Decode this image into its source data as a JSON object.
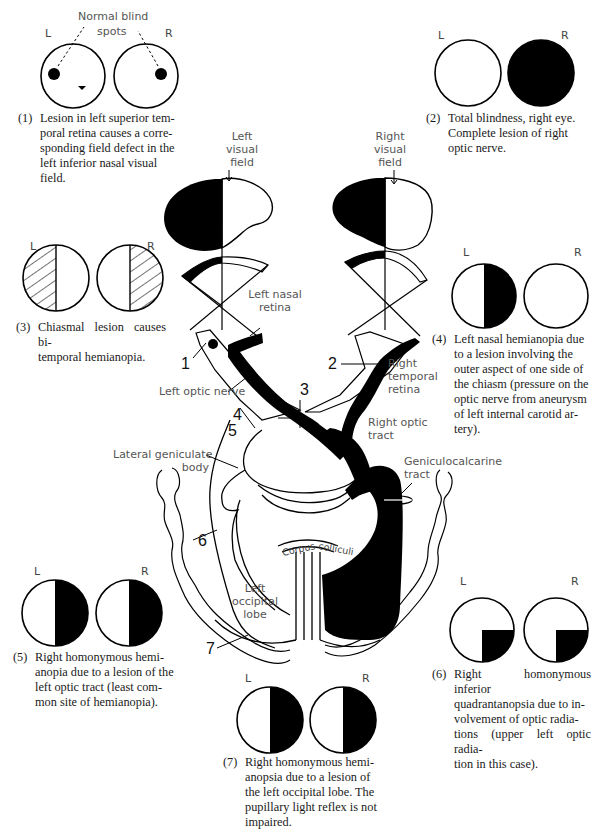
{
  "panels": [
    {
      "id": 1,
      "eye_left": "L",
      "eye_right": "R",
      "annotation": [
        "Normal blind",
        "spots"
      ],
      "number": "(1)",
      "caption": "Lesion in left superior temporal retina causes a corresponding field defect in the left inferior nasal visual field.",
      "caption_lines": [
        "Lesion in left superior tem-",
        "poral retina causes a corre-",
        "sponding field defect in the",
        "left inferior nasal visual",
        "field."
      ],
      "left_field": "blind spot + inferior nasal triangle defect",
      "right_field": "blind spot only"
    },
    {
      "id": 2,
      "eye_left": "L",
      "eye_right": "R",
      "number": "(2)",
      "caption_lines": [
        "Total blindness, right eye.",
        "Complete lesion of right",
        "optic nerve."
      ],
      "left_field": "normal",
      "right_field": "complete loss"
    },
    {
      "id": 3,
      "eye_left": "L",
      "eye_right": "R",
      "number": "(3)",
      "caption_lines": [
        "Chiasmal lesion causes bi-",
        "temporal hemianopia."
      ],
      "left_field": "temporal half hatched",
      "right_field": "temporal half hatched"
    },
    {
      "id": 4,
      "eye_left": "L",
      "eye_right": "R",
      "number": "(4)",
      "caption_lines": [
        "Left nasal hemianopia due",
        "to a lesion involving the",
        "outer aspect of one side of",
        "the chiasm (pressure on the",
        "optic nerve from aneurysm",
        "of left internal carotid ar-",
        "tery)."
      ],
      "left_field": "nasal (right) half black",
      "right_field": "normal"
    },
    {
      "id": 5,
      "eye_left": "L",
      "eye_right": "R",
      "number": "(5)",
      "caption_lines": [
        "Right homonymous hemi-",
        "anopia due to a lesion of the",
        "left optic tract (least com-",
        "mon site of hemianopia)."
      ],
      "left_field": "right half black",
      "right_field": "right half black"
    },
    {
      "id": 6,
      "eye_left": "L",
      "eye_right": "R",
      "number": "(6)",
      "caption_lines": [
        "Right homonymous inferior",
        "quadrantanopsia due to in-",
        "volvement of optic radia-",
        "tions (upper left optic radia-",
        "tion in this case)."
      ],
      "left_field": "lower right quadrant black",
      "right_field": "lower right quadrant black"
    },
    {
      "id": 7,
      "eye_left": "L",
      "eye_right": "R",
      "number": "(7)",
      "caption_lines": [
        "Right homonymous hemi-",
        "anopsia due to a lesion of",
        "the left occipital lobe. The",
        "pupillary light reflex is not",
        "impaired."
      ],
      "left_field": "right half black",
      "right_field": "right half black"
    }
  ],
  "diagram": {
    "labels": {
      "left_visual_field": [
        "Left",
        "visual",
        "field"
      ],
      "right_visual_field": [
        "Right",
        "visual",
        "field"
      ],
      "left_nasal_retina": [
        "Left nasal",
        "retina"
      ],
      "right_temporal_retina": [
        "Right",
        "temporal",
        "retina"
      ],
      "left_optic_nerve": "Left optic nerve",
      "right_optic_tract": [
        "Right optic",
        "tract"
      ],
      "lateral_geniculate_body": [
        "Lateral geniculate",
        "body"
      ],
      "geniculocalcarine_tract": [
        "Geniculocalcarine",
        "tract"
      ],
      "corpus_colliculi": [
        "Corpus",
        "colliculi"
      ],
      "left_occipital_lobe": [
        "Left",
        "occipital",
        "lobe"
      ]
    },
    "lesion_markers": [
      "1",
      "2",
      "3",
      "4",
      "5",
      "6",
      "7"
    ]
  },
  "colors": {
    "ink": "#000000",
    "background": "#ffffff",
    "label_gray": "#555555"
  }
}
